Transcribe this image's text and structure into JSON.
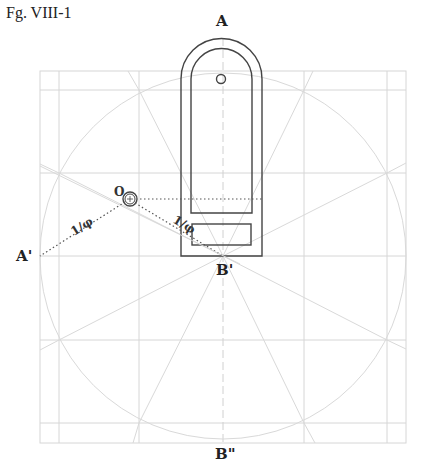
{
  "figure": {
    "caption": "Fg. VIII-1",
    "labels": {
      "A": "A",
      "A_prime": "A'",
      "B_prime": "B'",
      "B_double_prime": "B\"",
      "O": "O",
      "inv_phi_left": "1/φ",
      "inv_phi_right": "1/φ"
    },
    "colors": {
      "grid": "#d6d6d6",
      "object": "#444444",
      "text": "#222222"
    }
  }
}
